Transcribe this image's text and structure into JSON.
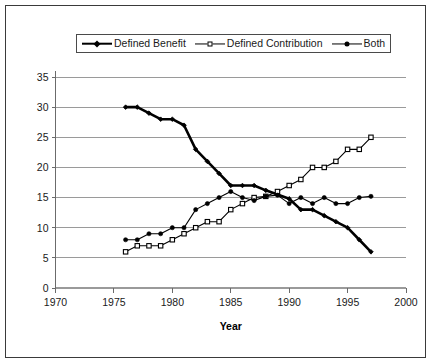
{
  "chart_data": {
    "type": "line",
    "title": "",
    "xlabel": "Year",
    "ylabel": "",
    "xlim": [
      1970,
      2000
    ],
    "ylim": [
      0,
      35
    ],
    "grid": true,
    "grid_axis": "y",
    "legend_position": "top-center",
    "x_ticks": [
      1970,
      1975,
      1980,
      1985,
      1990,
      1995,
      2000
    ],
    "x_tick_labels": [
      "1970",
      "1975",
      "1980",
      "1985",
      "1990",
      "1995",
      "2000"
    ],
    "y_ticks": [
      0,
      5,
      10,
      15,
      20,
      25,
      30,
      35
    ],
    "y_tick_labels": [
      "0",
      "5",
      "10",
      "15",
      "20",
      "25",
      "30",
      "35"
    ],
    "x": [
      1976,
      1977,
      1978,
      1979,
      1980,
      1981,
      1982,
      1983,
      1984,
      1985,
      1986,
      1987,
      1988,
      1989,
      1990,
      1991,
      1992,
      1993,
      1994,
      1995,
      1996,
      1997
    ],
    "series": [
      {
        "name": "Defined Benefit",
        "marker": "diamond",
        "line_width": 2.6,
        "color": "#000000",
        "values": [
          30,
          30,
          29,
          28,
          28,
          27,
          23,
          21,
          19,
          17,
          17,
          17,
          16.2,
          15.5,
          14.8,
          13,
          13,
          12,
          11,
          10,
          8,
          6
        ]
      },
      {
        "name": "Defined Contribution",
        "marker": "square-open",
        "line_width": 1.1,
        "color": "#000000",
        "values": [
          6,
          7,
          7,
          7,
          8,
          9,
          10,
          11,
          11,
          13,
          14,
          15,
          15.2,
          16,
          17,
          18,
          20,
          20,
          21,
          23,
          23,
          25
        ]
      },
      {
        "name": "Both",
        "marker": "circle",
        "line_width": 1.1,
        "color": "#000000",
        "values": [
          8,
          8,
          9,
          9,
          10,
          10,
          13,
          14,
          15,
          16,
          15,
          14.5,
          15.2,
          15.4,
          14,
          15,
          14,
          15,
          14,
          14,
          15,
          15.2
        ]
      }
    ]
  },
  "axis": {
    "x_title": "Year"
  }
}
